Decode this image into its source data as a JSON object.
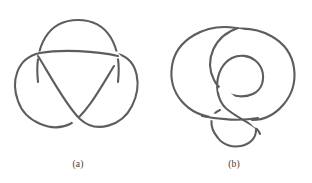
{
  "plate": {
    "background_color": "#ffffff",
    "stroke_color": "#5d5d5d",
    "caption_color": "#3a3a3a",
    "width": 312,
    "height": 183
  },
  "figures": [
    {
      "id": "a",
      "caption": "(a)",
      "knot_name": "trefoil-knot",
      "crossings": 3
    },
    {
      "id": "b",
      "caption": "(b)",
      "knot_name": "figure-eight-knot",
      "crossings": 4
    }
  ]
}
